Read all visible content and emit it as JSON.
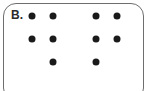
{
  "diagram": {
    "label": "B.",
    "dot_color": "#1a1a1a",
    "groups": [
      {
        "name": "left-group",
        "rows": [
          [
            1,
            1
          ],
          [
            1,
            1
          ],
          [
            0,
            1
          ]
        ]
      },
      {
        "name": "right-group",
        "rows": [
          [
            1,
            1
          ],
          [
            1,
            1
          ],
          [
            1,
            0
          ]
        ]
      }
    ]
  }
}
